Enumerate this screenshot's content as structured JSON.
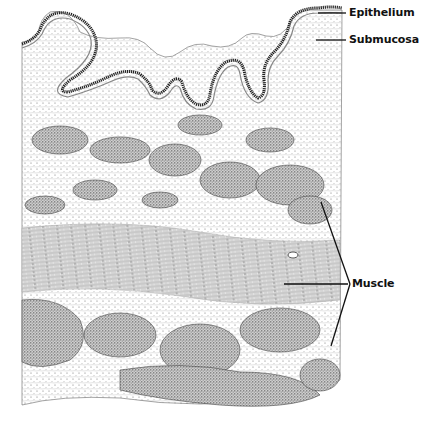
{
  "figure": {
    "type": "histology-illustration",
    "labels": [
      {
        "id": "epithelium",
        "text": "Epithelium"
      },
      {
        "id": "submucosa",
        "text": "Submucosa"
      },
      {
        "id": "muscle",
        "text": "Muscle"
      }
    ],
    "colors": {
      "ink": "#111111",
      "stipple": "#444444",
      "background": "#ffffff"
    }
  }
}
